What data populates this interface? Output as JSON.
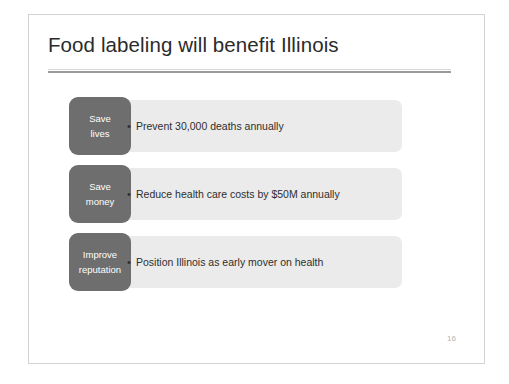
{
  "slide": {
    "title": "Food labeling will benefit Illinois",
    "page_number": "16",
    "colors": {
      "label_box": "#6e6e6e",
      "content_bar": "#ebebeb",
      "title_text": "#2b2b2b",
      "body_text": "#2e2e2e",
      "rule": "#9a9a9a",
      "slide_border": "#d2d2d2",
      "page_number": "#b4b4b4"
    },
    "rows": [
      {
        "label_line_1": "Save",
        "label_line_2": "lives",
        "bullet": "•",
        "text": "Prevent 30,000 deaths annually"
      },
      {
        "label_line_1": "Save",
        "label_line_2": "money",
        "bullet": "•",
        "text": "Reduce health care costs by $50M annually"
      },
      {
        "label_line_1": "Improve",
        "label_line_2": "reputation",
        "bullet": "•",
        "text": "Position Illinois as early mover on health"
      }
    ]
  }
}
